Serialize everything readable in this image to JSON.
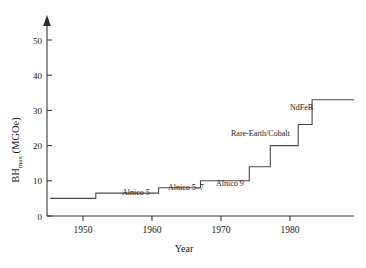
{
  "chart_data": {
    "type": "line",
    "title": "",
    "xlabel": "Year",
    "ylabel": "BH",
    "ylabel_sub": "max",
    "ylabel_unit": " (MGOe)",
    "ylabel_full": "BHmax (MGOe)",
    "xlim": [
      1946,
      1990
    ],
    "ylim": [
      0,
      55
    ],
    "grid": false,
    "legend": "none",
    "step_style": "post",
    "xticks": [
      1950,
      1960,
      1970,
      1980
    ],
    "xtick_labels": [
      "1950",
      "1960",
      "1970",
      "1980"
    ],
    "yticks": [
      0,
      10,
      20,
      30,
      40,
      50
    ],
    "ytick_labels": [
      "0",
      "10",
      "20",
      "30",
      "40",
      "50"
    ],
    "x": [
      1946.5,
      1953,
      1962,
      1968,
      1975,
      1978,
      1982,
      1984,
      1988
    ],
    "values": [
      5,
      6.5,
      8,
      10,
      14,
      20,
      26,
      33,
      33
    ],
    "series": [
      {
        "name": "BHmax",
        "points": [
          {
            "year": 1946.5,
            "value": 5
          },
          {
            "year": 1953,
            "value": 6.5
          },
          {
            "year": 1962,
            "value": 8
          },
          {
            "year": 1968,
            "value": 10
          },
          {
            "year": 1975,
            "value": 14
          },
          {
            "year": 1978,
            "value": 20
          },
          {
            "year": 1982,
            "value": 26
          },
          {
            "year": 1984,
            "value": 33
          },
          {
            "year": 1988,
            "value": 33
          }
        ]
      }
    ],
    "annotations": [
      {
        "id": "alnico-5",
        "text": "Alnico 5",
        "x": 122,
        "y": 195
      },
      {
        "id": "alnico-5-7",
        "text": "Alnico 5–7",
        "x": 168,
        "y": 190
      },
      {
        "id": "alnico-9",
        "text": "Alnico 9",
        "x": 216,
        "y": 186
      },
      {
        "id": "rare-earth-cobalt",
        "text": "Rare-Earth/Cobalt",
        "x": 231,
        "y": 136
      },
      {
        "id": "ndfeb",
        "text": "NdFeB",
        "x": 290,
        "y": 110
      }
    ],
    "colors": {
      "line": "#4a4a4a",
      "axis": "#3a3a3a",
      "text": "#1a1a1a",
      "background": "#ffffff"
    }
  },
  "axes": {
    "x_title": "Year",
    "y_title_main": "BH",
    "y_title_sub": "max",
    "y_title_unit": "(MGOe)"
  }
}
